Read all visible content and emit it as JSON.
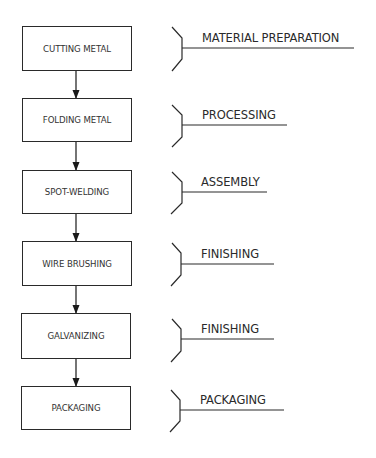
{
  "diagram": {
    "type": "process-flow",
    "steps": [
      {
        "label": "CUTTING METAL",
        "stage": "MATERIAL PREPARATION"
      },
      {
        "label": "FOLDING METAL",
        "stage": "PROCESSING"
      },
      {
        "label": "SPOT-WELDING",
        "stage": "ASSEMBLY"
      },
      {
        "label": "WIRE BRUSHING",
        "stage": "FINISHING"
      },
      {
        "label": "GALVANIZING",
        "stage": "FINISHING"
      },
      {
        "label": "PACKAGING",
        "stage": "PACKAGING"
      }
    ],
    "colors": {
      "line": "#2a2a2a",
      "text": "#333333",
      "background": "#ffffff"
    }
  }
}
